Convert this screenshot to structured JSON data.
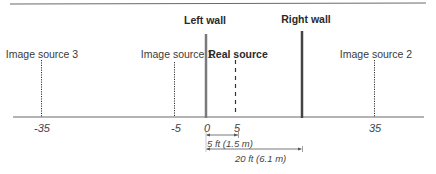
{
  "diagram": {
    "walls": [
      {
        "id": "left",
        "label": "Left wall",
        "position": 0
      },
      {
        "id": "right",
        "label": "Right wall",
        "position": 20
      }
    ],
    "sources": [
      {
        "id": "real",
        "label": "Real source",
        "position": 5,
        "style": "dashed"
      },
      {
        "id": "img1",
        "label": "Image source 1",
        "position": -5,
        "style": "dotted"
      },
      {
        "id": "img2",
        "label": "Image source 2",
        "position": 35,
        "style": "dotted"
      },
      {
        "id": "img3",
        "label": "Image source 3",
        "position": -35,
        "style": "dotted"
      }
    ],
    "axis": {
      "ticks": [
        "-35",
        "-5",
        "0",
        "5",
        "35"
      ]
    },
    "dimensions": [
      {
        "label": "5 ft  (1.5 m)",
        "from": 0,
        "to": 5
      },
      {
        "label": "20 ft  (6.1 m)",
        "from": 0,
        "to": 20
      }
    ],
    "colors": {
      "left_wall": "#7a7a7a",
      "right_wall": "#444444",
      "axis": "#6a6a6a",
      "top_rule": "#6a6a6a",
      "source_lines": "#333333"
    }
  }
}
